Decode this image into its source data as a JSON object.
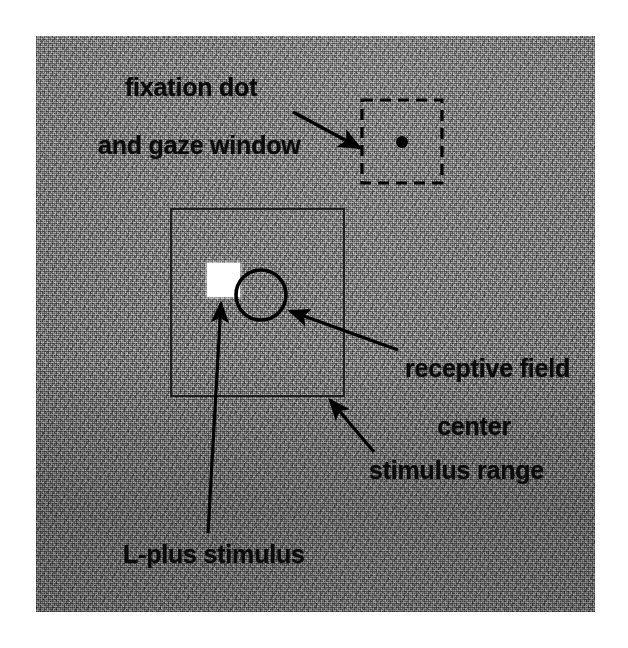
{
  "figure": {
    "type": "experimental-stimulus-diagram",
    "background_color": "#797979",
    "panel_texture": "grayscale-visual-noise",
    "canvas": {
      "width": 628,
      "height": 648
    }
  },
  "labels": {
    "fixation": {
      "line1": "fixation dot",
      "line2": "and gaze window",
      "color": "#0b0b0b"
    },
    "receptive_field": {
      "line1": "receptive field",
      "line2": "center",
      "color": "#0b0b0b"
    },
    "stimulus_range": {
      "text": "stimulus range",
      "color": "#0b0b0b"
    },
    "lplus_stimulus": {
      "text": "L-plus stimulus",
      "color": "#0b0b0b"
    }
  },
  "elements": {
    "gaze_window": {
      "shape": "dashed-square",
      "stroke": "#000000",
      "x": 362,
      "y": 100,
      "width": 80,
      "height": 83
    },
    "fixation_dot": {
      "shape": "filled-circle",
      "fill": "#000000",
      "cx": 402,
      "cy": 142,
      "r": 6
    },
    "stimulus_range_box": {
      "shape": "solid-square",
      "stroke": "#111111",
      "x": 171,
      "y": 209,
      "width": 173,
      "height": 187
    },
    "receptive_field_circle": {
      "shape": "circle-outline",
      "stroke": "#000000",
      "cx": 261,
      "cy": 295,
      "r": 25
    },
    "lplus_patch": {
      "shape": "filled-square",
      "fill": "#ffffff",
      "x": 207,
      "y": 263,
      "width": 33,
      "height": 34
    }
  },
  "arrows": [
    {
      "name": "arrow-to-gaze-window",
      "x1": 293,
      "y1": 112,
      "x2": 364,
      "y2": 150
    },
    {
      "name": "arrow-to-rf-center",
      "x1": 398,
      "y1": 350,
      "x2": 287,
      "y2": 309
    },
    {
      "name": "arrow-to-stimulus-range",
      "x1": 374,
      "y1": 452,
      "x2": 328,
      "y2": 397
    },
    {
      "name": "arrow-to-lplus-stimulus",
      "x1": 208,
      "y1": 533,
      "x2": 222,
      "y2": 300
    }
  ]
}
